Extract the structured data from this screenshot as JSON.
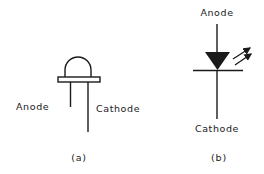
{
  "panels": [
    {
      "id": "a",
      "caption": "(a)",
      "title": "LED physical package",
      "labels": {
        "anode": "Anode",
        "cathode": "Cathode"
      }
    },
    {
      "id": "b",
      "caption": "(b)",
      "title": "LED circuit symbol",
      "labels": {
        "anode": "Anode",
        "cathode": "Cathode"
      }
    }
  ],
  "colors": {
    "stroke": "#1a1a1a",
    "background": "#ffffff"
  }
}
